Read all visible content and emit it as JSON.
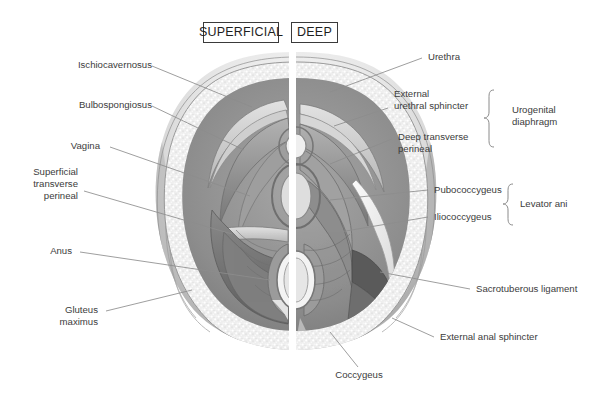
{
  "figure": {
    "background_color": "#ffffff",
    "label_color": "#3c3c3c",
    "leader_color": "#8c8c8c",
    "divider_color": "#ffffff"
  },
  "headers": {
    "superficial": "SUPERFICIAL",
    "deep": "DEEP"
  },
  "labels_left": [
    {
      "id": "ischiocavernosus",
      "text": "Ischiocavernosus"
    },
    {
      "id": "bulbospongiosus",
      "text": "Bulbospongiosus"
    },
    {
      "id": "vagina",
      "text": "Vagina"
    },
    {
      "id": "superficial-transverse-perineal",
      "text": "Superficial\ntransverse\nperineal"
    },
    {
      "id": "anus",
      "text": "Anus"
    },
    {
      "id": "gluteus-maximus",
      "text": "Gluteus\nmaximus"
    }
  ],
  "labels_right": [
    {
      "id": "urethra",
      "text": "Urethra"
    },
    {
      "id": "external-urethral-sphincter",
      "text": "External\nurethral sphincter"
    },
    {
      "id": "deep-transverse-perineal",
      "text": "Deep transverse\nperineal"
    },
    {
      "id": "pubococcygeus",
      "text": "Pubococcygeus"
    },
    {
      "id": "iliococcygeus",
      "text": "Iliococcygeus"
    },
    {
      "id": "sacrotuberous-ligament",
      "text": "Sacrotuberous ligament"
    },
    {
      "id": "external-anal-sphincter",
      "text": "External anal sphincter"
    }
  ],
  "labels_bottom": [
    {
      "id": "coccygeus",
      "text": "Coccygeus"
    }
  ],
  "group_labels": [
    {
      "id": "urogenital-diaphragm",
      "text": "Urogenital\ndiaphragm",
      "members": [
        "External urethral sphincter",
        "Deep transverse perineal"
      ]
    },
    {
      "id": "levator-ani",
      "text": "Levator ani",
      "members": [
        "Pubococcygeus",
        "Iliococcygeus"
      ]
    }
  ]
}
